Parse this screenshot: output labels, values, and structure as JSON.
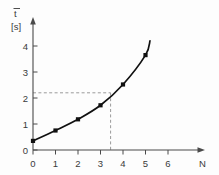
{
  "chart_data": {
    "type": "line",
    "title": "",
    "subtitle": "",
    "xlabel": "N",
    "ylabel": "t",
    "ylabel_overbar": true,
    "yunit": "[s]",
    "xlim": [
      0,
      6.6
    ],
    "ylim": [
      0,
      4.55
    ],
    "grid": false,
    "legend": null,
    "x_ticks": [
      "0",
      "1",
      "2",
      "3",
      "4",
      "5",
      "6"
    ],
    "x_tick_values": [
      0,
      1,
      2,
      3,
      4,
      5,
      6
    ],
    "y_ticks": [
      "0",
      "1",
      "2",
      "3",
      "4"
    ],
    "y_tick_values": [
      0,
      1,
      2,
      3,
      4
    ],
    "series": [
      {
        "name": "mean time vs N",
        "x": [
          0,
          1,
          2,
          3,
          4,
          5
        ],
        "values": [
          0.35,
          0.75,
          1.18,
          1.72,
          2.52,
          3.65
        ],
        "marker": "square",
        "color": "#111111",
        "curve_extends_to_x": 5.2,
        "curve_end_value": 4.2
      }
    ],
    "annotations": [
      {
        "type": "guide-horizontal",
        "value": 2.2,
        "from_x": 0,
        "to_x": 3.45,
        "style": "dashed",
        "color": "#9a9a9a"
      },
      {
        "type": "guide-vertical",
        "value": 3.45,
        "from_y": 0,
        "to_y": 2.2,
        "style": "dashed",
        "color": "#9a9a9a"
      }
    ]
  },
  "labels": {
    "y_axis_symbol": "t",
    "y_axis_unit": "[s]",
    "x_axis_symbol": "N"
  }
}
